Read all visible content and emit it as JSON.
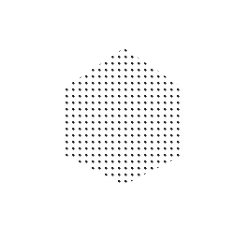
{
  "artwork": {
    "title": "Dotted Hexagon on Gray Square",
    "canvas": {
      "width": 249,
      "height": 235,
      "background_color": "#ffffff"
    },
    "layers": [
      {
        "name": "outer-margin",
        "shape": "rectangle",
        "fill_color": "#ffffff",
        "x": 0,
        "y": 0,
        "width": 249,
        "height": 235
      },
      {
        "name": "light-band",
        "shape": "rectangle",
        "fill_color": "#e8e8e8",
        "dither": "checkerboard",
        "dither_light": "#f2f2f2",
        "dither_dark": "#dcdcdc",
        "x": 10,
        "y": 8,
        "width": 223,
        "height": 214
      },
      {
        "name": "dark-square",
        "shape": "rectangle",
        "fill_color": "#6a6a6a",
        "dither": "checkerboard",
        "dither_light": "#7d7d7d",
        "dither_dark": "#4f4f4f",
        "x": 38,
        "y": 38,
        "width": 174,
        "height": 164
      },
      {
        "name": "dotted-hexagon",
        "shape": "hexagon",
        "fill_color": "#fdfdfd",
        "dot_color": "#151515",
        "dot_diameter_px": 2.3,
        "dot_spacing_px": 6.55,
        "orientation": "pointy-top",
        "x": 64,
        "y": 48,
        "width": 119,
        "height": 137,
        "vertices": [
          {
            "label": "top",
            "x": 124,
            "y": 48
          },
          {
            "label": "upper-right",
            "x": 183,
            "y": 88
          },
          {
            "label": "lower-right",
            "x": 183,
            "y": 155
          },
          {
            "label": "bottom",
            "x": 124,
            "y": 185
          },
          {
            "label": "lower-left",
            "x": 64,
            "y": 155
          },
          {
            "label": "upper-left",
            "x": 64,
            "y": 88
          }
        ],
        "clip_path": "polygon(50.4% 0%, 100% 29.2%, 100% 78.1%, 50.4% 100%, 0% 78.1%, 0% 29.2%)"
      }
    ]
  }
}
